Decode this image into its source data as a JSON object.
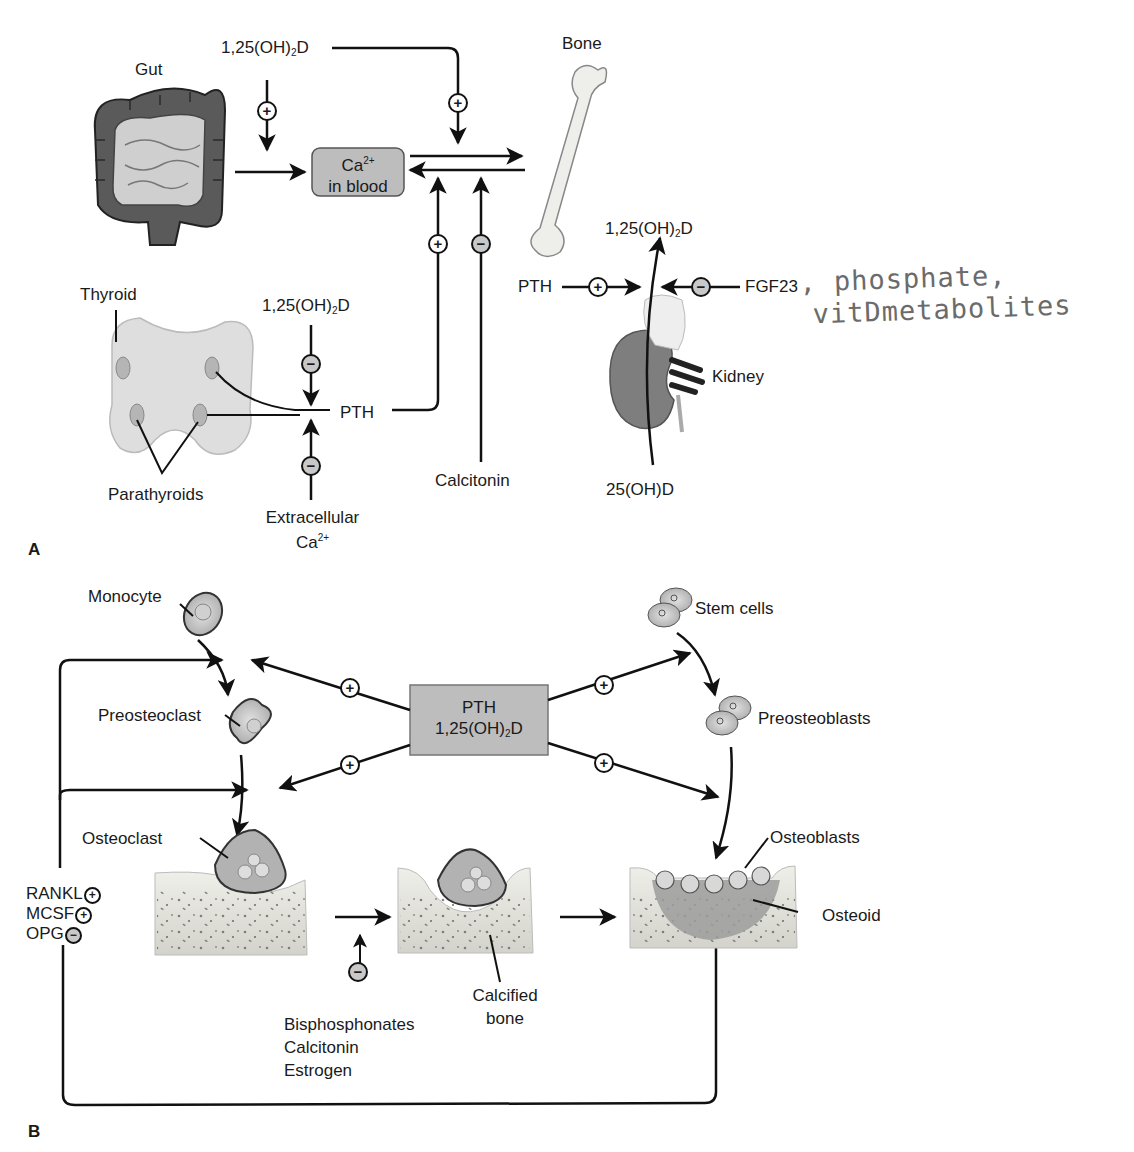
{
  "panel_a": {
    "letter": "A",
    "organs": {
      "gut": "Gut",
      "bone": "Bone",
      "thyroid": "Thyroid",
      "parathyroids": "Parathyroids",
      "kidney": "Kidney"
    },
    "ca_box": {
      "line1_base": "Ca",
      "line1_sup": "2+",
      "line2": "in blood"
    },
    "calcitriol_top": {
      "base": "1,25(OH)",
      "sub": "2",
      "tail": "D"
    },
    "calcitriol_parathyroid": {
      "base": "1,25(OH)",
      "sub": "2",
      "tail": "D"
    },
    "calcitriol_kidney": {
      "base": "1,25(OH)",
      "sub": "2",
      "tail": "D"
    },
    "pth_parathyroid": "PTH",
    "pth_kidney": "PTH",
    "fgf23": "FGF23",
    "calcitonin": "Calcitonin",
    "extracellular": {
      "line1": "Extracellular",
      "line2_base": "Ca",
      "line2_sup": "2+"
    },
    "precursor": "25(OH)D",
    "handwritten_note": {
      "line1": ", phosphate,",
      "line2": "vitDmetabolites"
    },
    "effects": {
      "calcitriol_on_gut": "+",
      "calcitriol_on_bone": "+",
      "pth_on_bone": "+",
      "calcitonin_on_bone": "−",
      "calcitriol_on_pth": "−",
      "extracellular_ca_on_pth": "−",
      "pth_on_kidney": "+",
      "fgf23_on_kidney": "−"
    }
  },
  "panel_b": {
    "letter": "B",
    "center_box": {
      "line1": "PTH",
      "line2_base": "1,25(OH)",
      "line2_sub": "2",
      "line2_tail": "D"
    },
    "cells": {
      "monocyte": "Monocyte",
      "preosteoclast": "Preosteoclast",
      "osteoclast": "Osteoclast",
      "stem_cells": "Stem cells",
      "preosteoblasts": "Preosteoblasts",
      "osteoblasts": "Osteoblasts",
      "osteoid": "Osteoid"
    },
    "calcified_bone": {
      "line1": "Calcified",
      "line2": "bone"
    },
    "regulators": [
      {
        "name": "RANKL",
        "effect": "+"
      },
      {
        "name": "MCSF",
        "effect": "+"
      },
      {
        "name": "OPG",
        "effect": "−"
      }
    ],
    "inhibitors": [
      "Bisphosphonates",
      "Calcitonin",
      "Estrogen"
    ],
    "inhibitor_effect": "−",
    "effects": {
      "to_monocyte_step": "+",
      "to_preosteoclast_step": "+",
      "to_stem_cell_step": "+",
      "to_preosteoblast_step": "+"
    }
  },
  "colors": {
    "organ_dark": "#4d4d4d",
    "organ_mid": "#8f8f8f",
    "organ_light": "#cfcfcf",
    "box_fill": "#bdbdbd",
    "bone_fill": "#e6e6e0",
    "handwriting": "#6b6b6b"
  }
}
